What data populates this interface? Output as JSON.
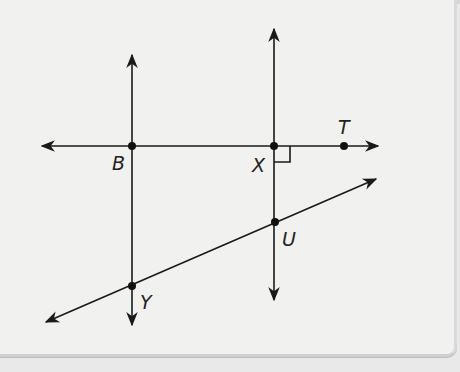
{
  "diagram": {
    "points": [
      {
        "label": "B",
        "x": 132,
        "y": 146
      },
      {
        "label": "X",
        "x": 274,
        "y": 146
      },
      {
        "label": "T",
        "x": 344,
        "y": 146
      },
      {
        "label": "U",
        "x": 275,
        "y": 222
      },
      {
        "label": "Y",
        "x": 132,
        "y": 286
      }
    ],
    "lines": [
      {
        "name": "line BT (horizontal)",
        "through": [
          "B",
          "X",
          "T"
        ]
      },
      {
        "name": "line BY (vertical)",
        "through": [
          "B",
          "Y"
        ]
      },
      {
        "name": "line XU (vertical)",
        "through": [
          "X",
          "U"
        ]
      },
      {
        "name": "transversal YU",
        "through": [
          "Y",
          "U"
        ]
      }
    ],
    "right_angle_at": "X",
    "labels": {
      "B": "B",
      "X": "X",
      "T": "T",
      "U": "U",
      "Y": "Y"
    }
  }
}
